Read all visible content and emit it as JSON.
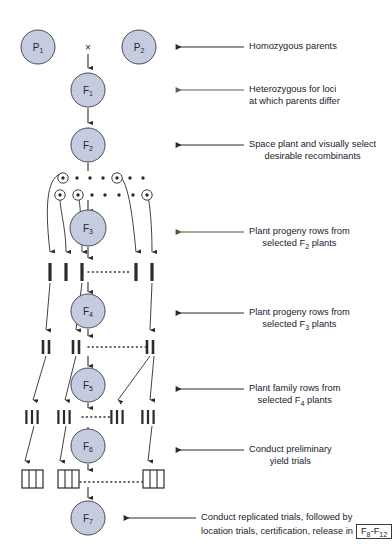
{
  "diagram": {
    "colors": {
      "circle_fill": "#c6cce0",
      "circle_stroke": "#4a4a55",
      "line": "#2b2b2b",
      "green_arrow": "#4a5a34",
      "text": "#21212e",
      "background": "#ffffff"
    },
    "cross_symbol": "×",
    "generations": [
      {
        "id": "P1",
        "letter": "P",
        "sub": "1",
        "cx": 38,
        "cy": 47,
        "r": 17
      },
      {
        "id": "P2",
        "letter": "P",
        "sub": "2",
        "cx": 139,
        "cy": 47,
        "r": 17
      },
      {
        "id": "F1",
        "letter": "F",
        "sub": "1",
        "cx": 88,
        "cy": 90,
        "r": 17
      },
      {
        "id": "F2",
        "letter": "F",
        "sub": "2",
        "cx": 88,
        "cy": 145,
        "r": 17
      },
      {
        "id": "F3",
        "letter": "F",
        "sub": "3",
        "cx": 88,
        "cy": 228,
        "r": 18
      },
      {
        "id": "F4",
        "letter": "F",
        "sub": "4",
        "cx": 88,
        "cy": 311,
        "r": 17
      },
      {
        "id": "F5",
        "letter": "F",
        "sub": "5",
        "cx": 88,
        "cy": 385,
        "r": 17
      },
      {
        "id": "F6",
        "letter": "F",
        "sub": "6",
        "cx": 88,
        "cy": 446,
        "r": 17
      },
      {
        "id": "F7",
        "letter": "F",
        "sub": "7",
        "cx": 88,
        "cy": 518,
        "r": 17
      }
    ],
    "annotations": [
      {
        "id": "homozygous-parents",
        "arrow_color": "#2b2b2b",
        "arrow_y": 47,
        "arrow_x1": 244,
        "arrow_x2": 176,
        "text_x": 249,
        "text_y": 41,
        "lines": [
          "Homozygous parents"
        ],
        "align": "left"
      },
      {
        "id": "heterozygous-loci",
        "arrow_color": "#5d5d5d",
        "arrow_y": 90,
        "arrow_x1": 244,
        "arrow_x2": 176,
        "text_x": 249,
        "text_y": 84,
        "lines": [
          "Heterozygous for loci",
          "at which parents differ"
        ],
        "align": "left"
      },
      {
        "id": "space-plant-select",
        "arrow_color": "#2b2b2b",
        "arrow_y": 145,
        "arrow_x1": 244,
        "arrow_x2": 176,
        "text_x": 249,
        "text_y": 139,
        "lines": [
          "Space plant and visually select",
          "desirable recombinants"
        ],
        "align": "left"
      },
      {
        "id": "progeny-rows-f2",
        "arrow_color": "#4a5a34",
        "arrow_y": 232,
        "arrow_x1": 244,
        "arrow_x2": 176,
        "text_x": 249,
        "text_y": 226,
        "lines": [
          "Plant progeny rows from",
          "selected F₂ plants"
        ],
        "align": "left"
      },
      {
        "id": "progeny-rows-f3",
        "arrow_color": "#2b2b2b",
        "arrow_y": 313,
        "arrow_x1": 244,
        "arrow_x2": 176,
        "text_x": 249,
        "text_y": 307,
        "lines": [
          "Plant progeny rows from",
          "selected F₃ plants"
        ],
        "align": "left"
      },
      {
        "id": "family-rows-f4",
        "arrow_color": "#2b2b2b",
        "arrow_y": 389,
        "arrow_x1": 244,
        "arrow_x2": 176,
        "text_x": 249,
        "text_y": 383,
        "lines": [
          "Plant family rows from",
          "selected F₄ plants"
        ],
        "align": "left"
      },
      {
        "id": "preliminary-yield-trials",
        "arrow_color": "#2b2b2b",
        "arrow_y": 450,
        "arrow_x1": 244,
        "arrow_x2": 176,
        "text_x": 249,
        "text_y": 444,
        "lines": [
          "Conduct preliminary",
          "yield trials"
        ],
        "align": "left"
      },
      {
        "id": "replicated-trials",
        "arrow_color": "#2b2b2b",
        "arrow_y": 518,
        "arrow_x1": 196,
        "arrow_x2": 124,
        "text_x": 201,
        "text_y": 512,
        "lines": [
          "Conduct replicated trials, followed by",
          "location trials, certification, release in"
        ],
        "boxed_label": "F₈-F₁₂",
        "align": "left"
      }
    ],
    "f2_population": {
      "description": "Space planted F2 population; circled dots are selected plants",
      "row1_y": 178,
      "row2_y": 195,
      "dot_r": 1.7,
      "circle_r": 5.2,
      "row1_dots": [
        {
          "x": 63,
          "selected": true
        },
        {
          "x": 77,
          "selected": false
        },
        {
          "x": 90,
          "selected": false
        },
        {
          "x": 103,
          "selected": false
        },
        {
          "x": 117,
          "selected": true
        },
        {
          "x": 130,
          "selected": false
        },
        {
          "x": 143,
          "selected": false
        }
      ],
      "row2_dots": [
        {
          "x": 60,
          "selected": true
        },
        {
          "x": 78,
          "selected": true
        },
        {
          "x": 92,
          "selected": false
        },
        {
          "x": 105,
          "selected": false
        },
        {
          "x": 119,
          "selected": false
        },
        {
          "x": 133,
          "selected": false
        },
        {
          "x": 147,
          "selected": true
        }
      ]
    },
    "row_stages": [
      {
        "id": "f3-rows",
        "y": 263,
        "bar_height": 18,
        "bar_width": 3.2,
        "groups": [
          {
            "x": 50,
            "bars": 1
          },
          {
            "x": 66,
            "bars": 1
          },
          {
            "x": 82,
            "bars": 1
          },
          {
            "x": 136,
            "bars": 1
          },
          {
            "x": 152,
            "bars": 1
          }
        ],
        "dotted_from": 88,
        "dotted_to": 132,
        "dotted_y": 272
      },
      {
        "id": "f4-rows",
        "y": 340,
        "bar_height": 14,
        "bar_width": 2.6,
        "groups": [
          {
            "x": 46,
            "bars": 2
          },
          {
            "x": 76,
            "bars": 2
          },
          {
            "x": 150,
            "bars": 2
          }
        ],
        "dotted_from": 88,
        "dotted_to": 146,
        "dotted_y": 347
      },
      {
        "id": "f5-rows",
        "y": 410,
        "bar_height": 14,
        "bar_width": 2.2,
        "groups": [
          {
            "x": 32,
            "bars": 3
          },
          {
            "x": 64,
            "bars": 3
          },
          {
            "x": 117,
            "bars": 3
          },
          {
            "x": 148,
            "bars": 3
          }
        ],
        "dotted_from": 82,
        "dotted_to": 112,
        "dotted_y": 417
      },
      {
        "id": "f6-plots",
        "y": 470,
        "box_height": 18,
        "box_width": 21,
        "boxes": [
          {
            "x": 22
          },
          {
            "x": 58
          },
          {
            "x": 143
          }
        ],
        "dotted_from": 80,
        "dotted_to": 142,
        "dotted_y": 482
      }
    ]
  }
}
